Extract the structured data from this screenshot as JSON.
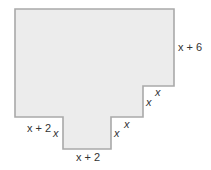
{
  "figure": {
    "shape": {
      "fill": "#ececec",
      "stroke": "#a9a9a9",
      "points": "15,9 174,9 174,86 143,86 143,117 111,117 111,149 63,149 63,117 15,117"
    },
    "labels": {
      "right_side": "x + 6",
      "step_upper_top": "x",
      "step_upper_side": "x",
      "step_lower_top": "x",
      "step_lower_side": "x",
      "left_shoulder": "x + 2",
      "stem_left": "x",
      "stem_bottom": "x + 2"
    }
  }
}
